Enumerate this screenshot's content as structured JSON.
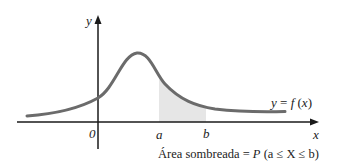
{
  "diagram": {
    "type": "probability-density-curve",
    "axes": {
      "x_label": "x",
      "y_label": "y",
      "origin_label": "0"
    },
    "curve_label": "y = f (x)",
    "interval": {
      "a_label": "a",
      "b_label": "b"
    },
    "caption": {
      "prefix": "Área sombreada = ",
      "P": "P",
      "expr": " (a ≤ X ≤ b)"
    },
    "colors": {
      "curve": "#6b6b6b",
      "shade": "#e6e6e6",
      "axis": "#1a1a1a"
    }
  }
}
